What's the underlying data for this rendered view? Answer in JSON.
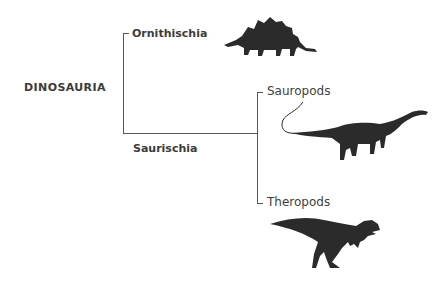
{
  "root": {
    "label": "DINOSAURIA"
  },
  "clades": [
    {
      "label": "Ornithischia",
      "icon": "stegosaurus-icon"
    },
    {
      "label": "Saurischia"
    }
  ],
  "subclades": [
    {
      "label": "Sauropods",
      "icon": "sauropod-icon"
    },
    {
      "label": "Theropods",
      "icon": "theropod-icon"
    }
  ],
  "colors": {
    "lines": "#555555",
    "silhouette": "#2b2b2b",
    "text": "#3b3b3b"
  }
}
